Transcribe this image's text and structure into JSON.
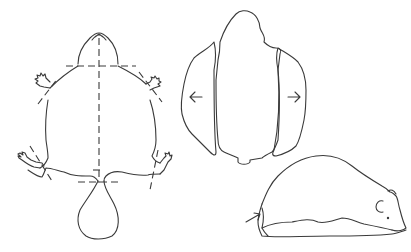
{
  "figure": {
    "background": "#ffffff",
    "line_color": "#3a3a3a",
    "panels": [
      {
        "id": "flat-skin",
        "description": "Dorsal view of flattened animal skin with dashed cutting guidelines",
        "elements": [
          "head",
          "fore-limbs",
          "hind-limbs",
          "tail",
          "vertical-midline-dashed",
          "horizontal-neck-dashed",
          "horizontal-tail-dashed",
          "limb-cut-dashes"
        ]
      },
      {
        "id": "skin-pattern",
        "description": "Cut skin pattern with central piece and two side flaps",
        "elements": [
          "central-piece",
          "left-flap",
          "right-flap",
          "left-arrow",
          "right-arrow"
        ]
      },
      {
        "id": "side-view",
        "description": "Side view of assembled specimen",
        "elements": [
          "body-outline",
          "ear",
          "eye",
          "base",
          "pointer-arrow"
        ]
      }
    ],
    "arrows": [
      {
        "panel": "skin-pattern",
        "direction": "left"
      },
      {
        "panel": "skin-pattern",
        "direction": "right"
      },
      {
        "panel": "side-view",
        "direction": "up-right"
      }
    ]
  }
}
